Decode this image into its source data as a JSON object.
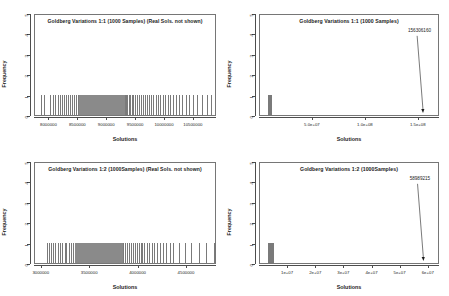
{
  "figure": {
    "background": "#ffffff",
    "bar_color": "#7a7a7a",
    "axis_color": "#4d4d4d",
    "text_color": "#1b1b1b"
  },
  "chart_data": [
    {
      "id": "top-left",
      "type": "bar",
      "title": "Goldberg Variations 1:1 (1000 Samples) (Real Sols. not shown)",
      "xlabel": "Solutions",
      "ylabel": "Frequency",
      "ylim": [
        0,
        5
      ],
      "ytick_labels": [
        "0",
        "1",
        "2",
        "3",
        "4",
        "5"
      ],
      "ytick_values": [
        0,
        1,
        2,
        3,
        4,
        5
      ],
      "xlim": [
        7750000,
        10900000
      ],
      "xtick_labels": [
        "8000000",
        "8500000",
        "9000000",
        "9500000",
        "10000000",
        "10500000"
      ],
      "xtick_values": [
        8000000,
        8500000,
        9000000,
        9500000,
        10000000,
        10500000
      ],
      "grid": false,
      "legend": "none",
      "note": "Dense histogram of unit-height spikes (frequency 1) spanning roughly 7.85e6 to 1.08e7, densest between 8.5e6 and 9.6e6",
      "bar_height": 1,
      "bar_positions": [
        7860000,
        7905000,
        8010000,
        8055000,
        8090000,
        8140000,
        8175000,
        8210000,
        8250000,
        8285000,
        8320000,
        8360000,
        8395000,
        8430000,
        8460000,
        8495000,
        8520000,
        8550000,
        8575000,
        8600000,
        8625000,
        8650000,
        8675000,
        8700000,
        8725000,
        8750000,
        8775000,
        8800000,
        8825000,
        8850000,
        8875000,
        8900000,
        8925000,
        8950000,
        8975000,
        9000000,
        9025000,
        9050000,
        9075000,
        9100000,
        9125000,
        9150000,
        9175000,
        9200000,
        9225000,
        9250000,
        9275000,
        9300000,
        9325000,
        9350000,
        9375000,
        9400000,
        9425000,
        9450000,
        9480000,
        9510000,
        9545000,
        9580000,
        9615000,
        9650000,
        9690000,
        9725000,
        9760000,
        9800000,
        9840000,
        9880000,
        9920000,
        9960000,
        10000000,
        10045000,
        10090000,
        10140000,
        10190000,
        10240000,
        10300000,
        10360000,
        10420000,
        10490000,
        10560000,
        10640000,
        10720000,
        10800000
      ]
    },
    {
      "id": "top-right",
      "type": "bar",
      "title": "Goldberg Variations 1:1 (1000 Samples)",
      "xlabel": "Solutions",
      "ylabel": "Frequency",
      "ylim": [
        0,
        5
      ],
      "ytick_labels": [
        "0",
        "1",
        "2",
        "3",
        "4",
        "5"
      ],
      "ytick_values": [
        0,
        1,
        2,
        3,
        4,
        5
      ],
      "xlim": [
        0,
        170000000
      ],
      "xtick_labels": [
        "5.0e+07",
        "1.0e+08",
        "1.5e+08"
      ],
      "xtick_values": [
        50000000,
        100000000,
        150000000
      ],
      "grid": false,
      "legend": "none",
      "annotation_label": "156306160",
      "annotation_value": 156306160,
      "note": "Single dense cluster of samples near the left edge plus one far outlier marked by an arrow",
      "bar_height": 1,
      "cluster_start": 7800000,
      "cluster_end": 11000000
    },
    {
      "id": "bottom-left",
      "type": "bar",
      "title": "Goldberg Variations 1:2 (1000Samples) (Real Sols. not shown)",
      "xlabel": "Solutions",
      "ylabel": "Frequency",
      "ylim": [
        0,
        5
      ],
      "ytick_labels": [
        "0",
        "1",
        "2",
        "3",
        "4",
        "5"
      ],
      "ytick_values": [
        0,
        1,
        2,
        3,
        4,
        5
      ],
      "xlim": [
        2930000,
        4810000
      ],
      "xtick_labels": [
        "3000000",
        "3500000",
        "4000000",
        "4500000"
      ],
      "xtick_values": [
        3000000,
        3500000,
        4000000,
        4500000
      ],
      "grid": false,
      "legend": "none",
      "note": "Dense histogram of unit-height spikes (frequency 1) spanning roughly 3.05e6 to 4.8e6, densest between 3.3e6 and 4.05e6",
      "bar_height": 1,
      "bar_positions": [
        3055000,
        3075000,
        3095000,
        3120000,
        3140000,
        3165000,
        3190000,
        3210000,
        3235000,
        3255000,
        3280000,
        3300000,
        3320000,
        3340000,
        3360000,
        3380000,
        3400000,
        3420000,
        3440000,
        3460000,
        3480000,
        3500000,
        3520000,
        3540000,
        3560000,
        3580000,
        3600000,
        3620000,
        3640000,
        3660000,
        3680000,
        3700000,
        3720000,
        3740000,
        3760000,
        3780000,
        3800000,
        3820000,
        3840000,
        3860000,
        3880000,
        3900000,
        3920000,
        3940000,
        3960000,
        3980000,
        4000000,
        4020000,
        4040000,
        4060000,
        4085000,
        4110000,
        4135000,
        4160000,
        4190000,
        4220000,
        4250000,
        4285000,
        4320000,
        4360000,
        4420000,
        4480000,
        4540000,
        4620000,
        4700000,
        4780000
      ]
    },
    {
      "id": "bottom-right",
      "type": "bar",
      "title": "Goldberg Variations 1:2 (1000Samples)",
      "xlabel": "Solutions",
      "ylabel": "Frequency",
      "ylim": [
        0,
        5
      ],
      "ytick_labels": [
        "0",
        "1",
        "2",
        "3",
        "4",
        "5"
      ],
      "ytick_values": [
        0,
        1,
        2,
        3,
        4,
        5
      ],
      "xlim": [
        0,
        64000000
      ],
      "xtick_labels": [
        "1e+07",
        "2e+07",
        "3e+07",
        "4e+07",
        "5e+07",
        "6e+07"
      ],
      "xtick_values": [
        10000000,
        20000000,
        30000000,
        40000000,
        50000000,
        60000000
      ],
      "grid": false,
      "legend": "none",
      "annotation_label": "58989215",
      "annotation_value": 58989215,
      "note": "Single dense cluster of samples near the left edge plus one far outlier marked by an arrow",
      "bar_height": 1,
      "cluster_start": 2900000,
      "cluster_end": 4850000
    }
  ]
}
